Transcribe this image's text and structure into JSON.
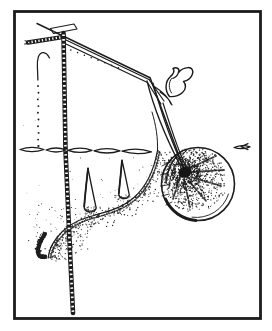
{
  "figure": {
    "alt": "Black-and-white engraved illustration: a slender vertical rod with regular tick marks and a flat T-shaped cap; long diagonal stems slanting down to the right meet at a small two-pronged claw-like hook; steep strands descend from the hook into a large round stippled ball with a dark radial core; a twisted chain-like strand runs horizontally across the middle; a long curved edge shaded with dense stippling carries two upright thorn-like spikes; the shading trails off into a small dark curl at the lower left.",
    "style": "pen-and-ink engraving, stipple shading",
    "colors": {
      "ink": "#1c1c1c",
      "paper": "#ffffff"
    },
    "elements": [
      {
        "name": "border-frame",
        "desc": "thick rectangular ink border around the drawing"
      },
      {
        "name": "measuring-rod",
        "desc": "near-vertical rod with regular light tick marks"
      },
      {
        "name": "rod-cap",
        "desc": "flat dark T-shaped cap on top of the rod"
      },
      {
        "name": "textured-branch",
        "desc": "short segmented branch running left from the rod"
      },
      {
        "name": "diagonal-stems",
        "desc": "thin double stems slanting down to the right"
      },
      {
        "name": "hook-claw",
        "desc": "small two-pronged claw-shaped hook where stems cross"
      },
      {
        "name": "hanging-strands",
        "desc": "steep strands running from the hook into the ball"
      },
      {
        "name": "twisted-strand",
        "desc": "horizontal chain of elongated twisted links"
      },
      {
        "name": "stippled-ball",
        "desc": "large sphere shaded with stipple dots and dark radial core"
      },
      {
        "name": "thorn-spike-left",
        "desc": "upright tapered thorn on the curved edge"
      },
      {
        "name": "thorn-spike-right",
        "desc": "second upright tapered thorn"
      },
      {
        "name": "curved-edge",
        "desc": "long sweeping curve shaded densely below with stipple"
      },
      {
        "name": "stipple-tail",
        "desc": "small dark curled tail of shading at lower left"
      },
      {
        "name": "dotted-guides",
        "desc": "rows of small dots along the left curve and diagonal"
      }
    ]
  }
}
